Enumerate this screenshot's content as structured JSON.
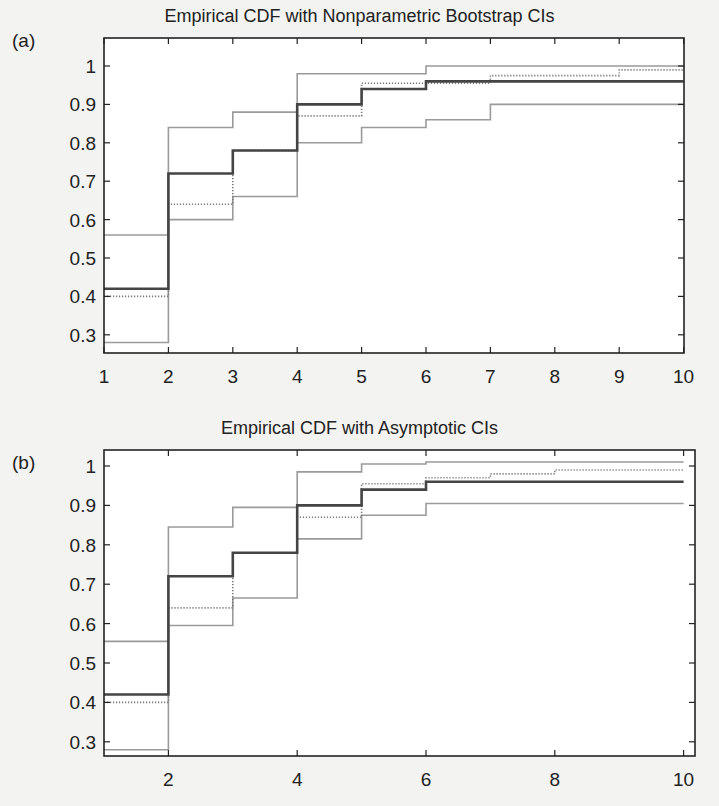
{
  "figure": {
    "panels": [
      {
        "label": "(a)",
        "title": "Empirical CDF with Nonparametric Bootstrap CIs"
      },
      {
        "label": "(b)",
        "title": "Empirical CDF with Asymptotic CIs"
      }
    ]
  },
  "colors": {
    "ecdf": "#444444",
    "ci_band": "#9a9a9a",
    "dotted": "#777777",
    "axis": "#222222",
    "background": "#f3f3f1",
    "plot_bg": "#ffffff"
  },
  "chart_data": [
    {
      "type": "line",
      "subtype": "step",
      "title": "Empirical CDF with Nonparametric Bootstrap CIs",
      "panel_label": "(a)",
      "xlabel": "",
      "ylabel": "",
      "xlim": [
        1,
        10
      ],
      "ylim": [
        0.26,
        1.03
      ],
      "xticks": [
        1,
        2,
        3,
        4,
        5,
        6,
        7,
        8,
        9,
        10
      ],
      "yticks": [
        0.3,
        0.4,
        0.5,
        0.6,
        0.7,
        0.8,
        0.9,
        1
      ],
      "ytick_labels": [
        "0.3",
        "0.4",
        "0.5",
        "0.6",
        "0.7",
        "0.8",
        "0.9",
        "1"
      ],
      "grid": false,
      "legend": null,
      "x": [
        1,
        2,
        3,
        4,
        5,
        6,
        7,
        8,
        9,
        10
      ],
      "series": [
        {
          "name": "Empirical CDF",
          "style": "solid-dark",
          "values": [
            0.42,
            0.72,
            0.78,
            0.9,
            0.94,
            0.96,
            0.96,
            0.96,
            0.96,
            0.96
          ]
        },
        {
          "name": "Upper CI",
          "style": "solid-gray",
          "values": [
            0.56,
            0.84,
            0.88,
            0.98,
            0.98,
            1.0,
            1.0,
            1.0,
            1.0,
            1.0
          ]
        },
        {
          "name": "Lower CI",
          "style": "solid-gray",
          "values": [
            0.28,
            0.6,
            0.66,
            0.8,
            0.84,
            0.86,
            0.9,
            0.9,
            0.9,
            0.9
          ]
        },
        {
          "name": "Reference CDF",
          "style": "dotted",
          "values": [
            0.4,
            0.64,
            0.78,
            0.87,
            0.955,
            0.955,
            0.975,
            0.975,
            0.99,
            0.99
          ]
        }
      ]
    },
    {
      "type": "line",
      "subtype": "step",
      "title": "Empirical CDF with Asymptotic CIs",
      "panel_label": "(b)",
      "xlabel": "",
      "ylabel": "",
      "xlim": [
        1,
        10.2
      ],
      "ylim": [
        0.26,
        1.04
      ],
      "xticks": [
        2,
        4,
        6,
        8,
        10
      ],
      "yticks": [
        0.3,
        0.4,
        0.5,
        0.6,
        0.7,
        0.8,
        0.9,
        1
      ],
      "ytick_labels": [
        "0.3",
        "0.4",
        "0.5",
        "0.6",
        "0.7",
        "0.8",
        "0.9",
        "1"
      ],
      "grid": false,
      "legend": null,
      "x": [
        1,
        2,
        3,
        4,
        5,
        6,
        7,
        8,
        9,
        10
      ],
      "series": [
        {
          "name": "Empirical CDF",
          "style": "solid-dark",
          "values": [
            0.42,
            0.72,
            0.78,
            0.9,
            0.94,
            0.96,
            0.96,
            0.96,
            0.96,
            0.96
          ]
        },
        {
          "name": "Upper CI",
          "style": "solid-gray",
          "values": [
            0.555,
            0.845,
            0.895,
            0.985,
            1.005,
            1.01,
            1.01,
            1.01,
            1.01,
            1.01
          ]
        },
        {
          "name": "Lower CI",
          "style": "solid-gray",
          "values": [
            0.28,
            0.595,
            0.665,
            0.815,
            0.875,
            0.905,
            0.905,
            0.905,
            0.905,
            0.905
          ]
        },
        {
          "name": "Reference CDF",
          "style": "dotted",
          "values": [
            0.4,
            0.64,
            0.78,
            0.87,
            0.955,
            0.97,
            0.98,
            0.99,
            0.99,
            0.99
          ]
        }
      ]
    }
  ]
}
